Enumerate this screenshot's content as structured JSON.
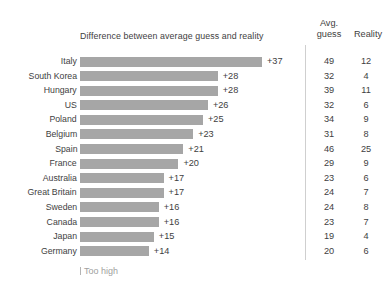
{
  "chart_data": {
    "type": "bar",
    "orientation": "horizontal",
    "title": "Difference between average guess and reality",
    "xlabel": "",
    "ylabel": "",
    "grid": false,
    "legend_position": "bottom-left",
    "legend": [
      "Too high"
    ],
    "categories": [
      "Italy",
      "South Korea",
      "Hungary",
      "US",
      "Poland",
      "Belgium",
      "Spain",
      "France",
      "Australia",
      "Great Britain",
      "Sweden",
      "Canada",
      "Japan",
      "Germany"
    ],
    "values": [
      37,
      28,
      28,
      26,
      25,
      23,
      21,
      20,
      17,
      17,
      16,
      16,
      15,
      14
    ],
    "value_labels": [
      "+37",
      "+28",
      "+28",
      "+26",
      "+25",
      "+23",
      "+21",
      "+20",
      "+17",
      "+17",
      "+16",
      "+16",
      "+15",
      "+14"
    ],
    "xlim": [
      0,
      37
    ],
    "series": [
      {
        "name": "Avg. guess",
        "values": [
          49,
          32,
          39,
          32,
          34,
          31,
          46,
          29,
          23,
          24,
          24,
          23,
          19,
          20
        ]
      },
      {
        "name": "Reality",
        "values": [
          12,
          4,
          11,
          6,
          9,
          8,
          25,
          9,
          6,
          7,
          8,
          7,
          4,
          6
        ]
      }
    ],
    "bar_color": "#a6a6a6",
    "text_color": "#3e3e3e",
    "legend_color": "#a0a0a0"
  },
  "table": {
    "header": {
      "avg_line1": "Avg.",
      "avg_line2": "guess",
      "reality": "Reality"
    }
  },
  "legend": {
    "too_high_label": "Too high"
  }
}
